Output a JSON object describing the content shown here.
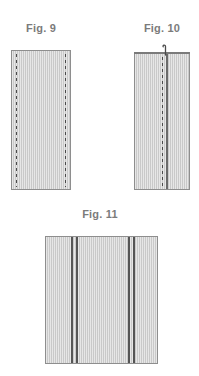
{
  "document": {
    "type": "patent-figure-sheet",
    "background_color": "#ffffff"
  },
  "palette": {
    "fabric_fill": "#c9c9c9",
    "fabric_border": "#8e8e8e",
    "stitch_color": "#4a4a4a",
    "seam_color": "#6a6a6a",
    "seam_dark_color": "#555555",
    "caption_color": "#7b7b7b"
  },
  "figures": [
    {
      "id": "fig-9",
      "caption": "Fig. 9",
      "description": "Rectangular fabric panel with two vertical dashed stitch lines near left and right edges",
      "elements": [
        {
          "name": "fabric-panel",
          "kind": "panel"
        },
        {
          "name": "stitch-line-left",
          "kind": "dashed-line"
        },
        {
          "name": "stitch-line-right",
          "kind": "dashed-line"
        }
      ]
    },
    {
      "id": "fig-10",
      "caption": "Fig. 10",
      "description": "Fabric panel folded, showing a dark top edge bar, a vertical fold seam and a vertical dashed stitch line, with a small hook mark at the top",
      "elements": [
        {
          "name": "fabric-panel",
          "kind": "panel"
        },
        {
          "name": "top-edge-bar",
          "kind": "edge-bar"
        },
        {
          "name": "stitch-line-center",
          "kind": "dashed-line"
        },
        {
          "name": "fold-seam",
          "kind": "solid-line"
        },
        {
          "name": "hook-mark",
          "kind": "hook"
        }
      ]
    },
    {
      "id": "fig-11",
      "caption": "Fig. 11",
      "description": "Wide fabric panel with two pairs of dark vertical seam stripes",
      "elements": [
        {
          "name": "fabric-panel",
          "kind": "panel"
        },
        {
          "name": "seam-stripe-left-outer",
          "kind": "solid-line"
        },
        {
          "name": "seam-stripe-left-inner",
          "kind": "solid-line"
        },
        {
          "name": "seam-stripe-right-outer",
          "kind": "solid-line"
        },
        {
          "name": "seam-stripe-right-inner",
          "kind": "solid-line"
        }
      ]
    }
  ]
}
